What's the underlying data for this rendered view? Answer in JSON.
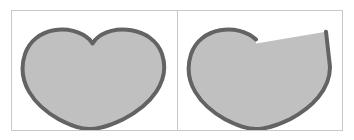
{
  "figure": {
    "background_color": "#ffffff",
    "frame_border_color": "#c8c8c8",
    "divider_color": "#c8c8c8",
    "panel_count": 2
  },
  "style": {
    "fill_color": "#c0c0c0",
    "stroke_color": "#636363",
    "stroke_width": 4,
    "cut_edge_stroke": "none"
  },
  "panels": [
    {
      "id": "left",
      "shape_name": "heart-complete",
      "description": "Complete heart outline",
      "fill_color": "#c0c0c0",
      "stroke_color": "#636363",
      "has_cut": false,
      "path": "M 78 29 C 60 12, 22 16, 13 44 C 4 72, 22 96, 47 110 C 62 118, 73 120, 78 120 C 83 120, 96 118, 112 110 C 139 96, 160 72, 151 44 C 142 16, 100 12, 84 29 L 81 33 Z"
    },
    {
      "id": "right",
      "shape_name": "heart-clipped",
      "description": "Heart with right lobe truncated by a straight diagonal cut",
      "fill_color": "#c0c0c0",
      "stroke_color": "#636363",
      "has_cut": true,
      "cut_start": [
        78,
        33
      ],
      "cut_end": [
        148,
        21
      ],
      "path_outline": "M 78 29 C 60 12, 22 16, 13 44 C 4 72, 22 96, 47 110 C 62 118, 73 120, 78 120 C 83 120, 96 118, 112 110 C 134 98, 152 80, 152 57 L 148 21",
      "path_fill": "M 78 33 L 148 21 C 152 40, 152 57, 152 57 C 152 80, 134 98, 112 110 C 96 118, 83 120, 78 120 C 73 120, 62 118, 47 110 C 22 96, 4 72, 13 44 C 22 16, 60 12, 78 29 Z"
    }
  ]
}
